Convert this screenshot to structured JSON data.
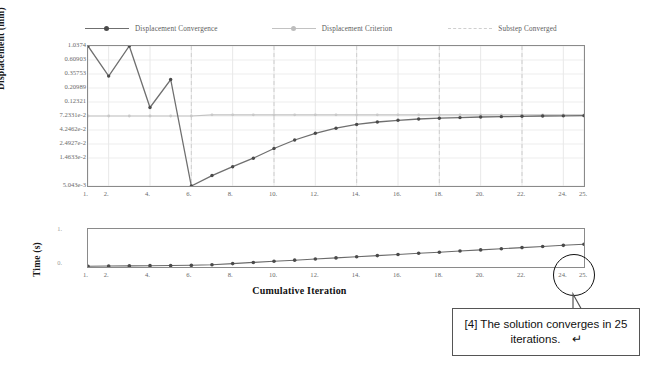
{
  "legend": {
    "items": [
      {
        "label": "Displacement Convergence",
        "style": "solid-marker",
        "color": "#6f6f6f"
      },
      {
        "label": "Displacement Criterion",
        "style": "solid-marker",
        "color": "#c2c2c2"
      },
      {
        "label": "Substep Converged",
        "style": "dashed",
        "color": "#cfcfcf"
      }
    ]
  },
  "annotation": {
    "callout_text": "[4] The solution converges in 25 iterations.",
    "enter_glyph": "↵",
    "circled_tick": "25."
  },
  "chart_data": [
    {
      "type": "line",
      "id": "displacement-convergence",
      "title": "",
      "xlabel": "",
      "ylabel": "Displacement (mm)",
      "yscale": "log",
      "ylim": [
        0.005043,
        1.0374
      ],
      "xlim": [
        1,
        25
      ],
      "grid": true,
      "legend_position": "top",
      "ytick_labels": [
        "1.0374",
        "0.60903",
        "0.35753",
        "0.20989",
        "0.12321",
        "7.2331e-2",
        "4.2462e-2",
        "2.4927e-2",
        "1.4633e-2",
        "5.043e-3"
      ],
      "ytick_values": [
        1.0374,
        0.60903,
        0.35753,
        0.20989,
        0.12321,
        0.072331,
        0.042462,
        0.024927,
        0.014633,
        0.005043
      ],
      "xtick_labels": [
        "1.",
        "2.",
        "4.",
        "6.",
        "8.",
        "10.",
        "12.",
        "14.",
        "16.",
        "18.",
        "20.",
        "22.",
        "24.",
        "25."
      ],
      "xtick_values": [
        1,
        2,
        4,
        6,
        8,
        10,
        12,
        14,
        16,
        18,
        20,
        22,
        24,
        25
      ],
      "substep_converged_lines": [
        6,
        10,
        14,
        18,
        22
      ],
      "series": [
        {
          "name": "Displacement Convergence",
          "color": "#6f6f6f",
          "markers": true,
          "x": [
            1,
            2,
            3,
            4,
            5,
            6,
            7,
            8,
            9,
            10,
            11,
            12,
            13,
            14,
            15,
            16,
            17,
            18,
            19,
            20,
            21,
            22,
            23,
            24,
            25
          ],
          "values": [
            1.0374,
            0.33,
            1.0374,
            0.1,
            0.29,
            0.005043,
            0.0075,
            0.0105,
            0.0145,
            0.021,
            0.029,
            0.0375,
            0.0455,
            0.0525,
            0.0575,
            0.0615,
            0.0645,
            0.0665,
            0.068,
            0.0695,
            0.0705,
            0.0715,
            0.0722,
            0.0728,
            0.0733
          ]
        },
        {
          "name": "Displacement Criterion",
          "color": "#c2c2c2",
          "markers": true,
          "x": [
            1,
            2,
            3,
            4,
            5,
            6,
            7,
            8,
            9,
            10,
            11,
            12,
            13,
            14,
            15,
            16,
            17,
            18,
            19,
            20,
            21,
            22,
            23,
            24,
            25
          ],
          "values": [
            0.0723,
            0.0723,
            0.0723,
            0.0723,
            0.0723,
            0.0723,
            0.0755,
            0.0755,
            0.0755,
            0.0755,
            0.0755,
            0.0755,
            0.0755,
            0.0755,
            0.0755,
            0.0755,
            0.0755,
            0.0755,
            0.0755,
            0.0755,
            0.0755,
            0.0755,
            0.0755,
            0.0755,
            0.0755
          ]
        }
      ]
    },
    {
      "type": "line",
      "id": "cumulative-time",
      "title": "",
      "xlabel": "Cumulative Iteration",
      "ylabel": "Time (s)",
      "yscale": "linear",
      "ylim": [
        0,
        1
      ],
      "xlim": [
        1,
        25
      ],
      "grid": false,
      "ytick_labels": [
        "1.",
        "0."
      ],
      "ytick_values": [
        1,
        0
      ],
      "xtick_labels": [
        "1.",
        "2.",
        "4.",
        "6.",
        "8.",
        "10.",
        "12.",
        "14.",
        "16.",
        "18.",
        "20.",
        "22.",
        "24.",
        "25."
      ],
      "xtick_values": [
        1,
        2,
        4,
        6,
        8,
        10,
        12,
        14,
        16,
        18,
        20,
        22,
        24,
        25
      ],
      "series": [
        {
          "name": "Time",
          "color": "#6a6a6a",
          "markers": true,
          "x": [
            1,
            2,
            3,
            4,
            5,
            6,
            7,
            8,
            9,
            10,
            11,
            12,
            13,
            14,
            15,
            16,
            17,
            18,
            19,
            20,
            21,
            22,
            23,
            24,
            25
          ],
          "values": [
            0.02,
            0.025,
            0.03,
            0.035,
            0.04,
            0.045,
            0.06,
            0.09,
            0.12,
            0.15,
            0.18,
            0.21,
            0.24,
            0.27,
            0.3,
            0.33,
            0.36,
            0.39,
            0.42,
            0.45,
            0.48,
            0.51,
            0.54,
            0.57,
            0.6
          ]
        }
      ]
    }
  ]
}
